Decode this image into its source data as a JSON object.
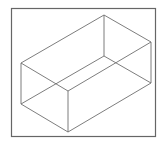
{
  "diagram": {
    "type": "wireframe-cuboid",
    "colors": {
      "background": "#ffffff",
      "frame": "#666666",
      "edge": "#6e6e6e"
    },
    "frame": {
      "x": 11.5,
      "y": 8.5,
      "width": 144,
      "height": 128
    },
    "vertices": {
      "top_back": [
        104,
        15
      ],
      "top_right": [
        151,
        42
      ],
      "top_left": [
        21,
        63
      ],
      "top_front": [
        68,
        91
      ],
      "bottom_back": [
        104,
        56
      ],
      "bottom_right": [
        151,
        83
      ],
      "bottom_left": [
        21,
        104
      ],
      "bottom_front": [
        68,
        132
      ]
    },
    "edges": [
      [
        "top_back",
        "top_right"
      ],
      [
        "top_back",
        "top_left"
      ],
      [
        "top_left",
        "top_front"
      ],
      [
        "top_front",
        "top_right"
      ],
      [
        "bottom_back",
        "bottom_right"
      ],
      [
        "bottom_back",
        "bottom_left"
      ],
      [
        "bottom_left",
        "bottom_front"
      ],
      [
        "bottom_front",
        "bottom_right"
      ],
      [
        "top_back",
        "bottom_back"
      ],
      [
        "top_right",
        "bottom_right"
      ],
      [
        "top_left",
        "bottom_left"
      ],
      [
        "top_front",
        "bottom_front"
      ]
    ]
  }
}
